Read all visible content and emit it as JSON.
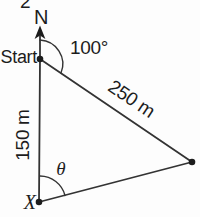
{
  "diagram": {
    "question_number": "2",
    "compass": {
      "north_label": "N"
    },
    "points": {
      "start_label": "Start",
      "x_label": "X"
    },
    "angles": {
      "bearing_at_start": "100°",
      "theta_at_x": "θ"
    },
    "lengths": {
      "hypotenuse": "250 m",
      "vertical_side": "150 m"
    },
    "colors": {
      "line": "#333333",
      "ink": "#1c1c1c",
      "background": "#fdfdfd"
    }
  }
}
